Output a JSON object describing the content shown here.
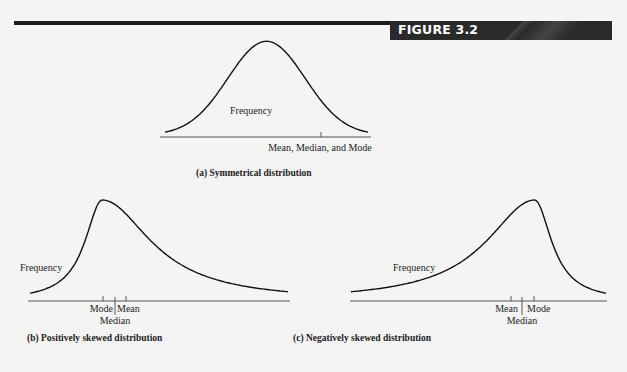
{
  "figure": {
    "label": "FIGURE 3.2",
    "header_color": "#1e1e1e"
  },
  "chart_data": [
    {
      "type": "line",
      "id": "a",
      "title": "(a) Symmetrical distribution",
      "ylabel": "Frequency",
      "shape": "symmetrical",
      "markers": [
        {
          "name": "Mean, Median, and Mode",
          "position": 0.5
        }
      ],
      "marker_label": "Mean, Median, and Mode"
    },
    {
      "type": "line",
      "id": "b",
      "title": "(b) Positively skewed distribution",
      "ylabel": "Frequency",
      "shape": "right-skewed",
      "markers": [
        {
          "name": "Mode",
          "position": 0.28
        },
        {
          "name": "Median",
          "position": 0.33
        },
        {
          "name": "Mean",
          "position": 0.375
        }
      ]
    },
    {
      "type": "line",
      "id": "c",
      "title": "(c) Negatively skewed distribution",
      "ylabel": "Frequency",
      "shape": "left-skewed",
      "markers": [
        {
          "name": "Mean",
          "position": 0.625
        },
        {
          "name": "Median",
          "position": 0.67
        },
        {
          "name": "Mode",
          "position": 0.72
        }
      ]
    }
  ]
}
